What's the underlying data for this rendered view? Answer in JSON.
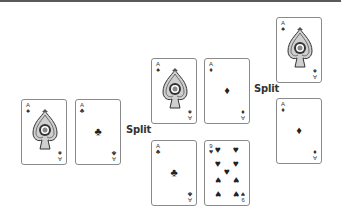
{
  "labels": {
    "split_1": "Split",
    "split_2": "Split"
  },
  "colors": {
    "card_border": "#8a8a8a",
    "ink": "#222222",
    "top_bar": "#5a5a5a"
  },
  "stages": {
    "initial_hand": {
      "cards": [
        {
          "rank": "A",
          "suit": "♠",
          "suit_name": "spades",
          "face": "ornate-ace-of-spades"
        },
        {
          "rank": "A",
          "suit": "♣",
          "suit_name": "clubs",
          "face": "single-pip"
        }
      ]
    },
    "after_first_split": {
      "hand_1": [
        {
          "rank": "A",
          "suit": "♠",
          "suit_name": "spades",
          "face": "ornate-ace-of-spades"
        },
        {
          "rank": "A",
          "suit": "♦",
          "suit_name": "diamonds",
          "face": "single-pip"
        }
      ],
      "hand_2": [
        {
          "rank": "A",
          "suit": "♣",
          "suit_name": "clubs",
          "face": "single-pip"
        },
        {
          "rank": "9",
          "suit": "♥",
          "suit_name": "hearts",
          "face": "nine-pips"
        }
      ]
    },
    "after_second_split": {
      "cards": [
        {
          "rank": "A",
          "suit": "♠",
          "suit_name": "spades",
          "face": "ornate-ace-of-spades"
        },
        {
          "rank": "A",
          "suit": "♦",
          "suit_name": "diamonds",
          "face": "single-pip"
        }
      ]
    }
  }
}
